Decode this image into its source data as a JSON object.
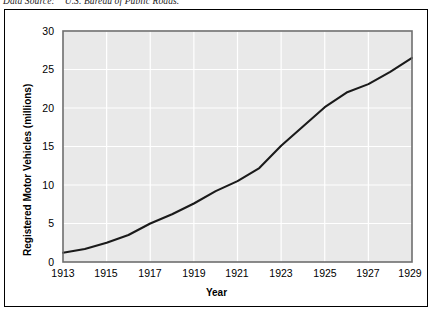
{
  "source_note": "Data Source:    U.S. Bureau of Public Roads.",
  "chart_data": {
    "type": "line",
    "title": "",
    "xlabel": "Year",
    "ylabel": "Registered Motor Vehicles (millions)",
    "xlim": [
      1913,
      1929
    ],
    "ylim": [
      0,
      30
    ],
    "grid": true,
    "legend": "none",
    "line_color": "#1a1a1a",
    "plot_background": "#e9e9e9",
    "gridline_color": "#ffffff",
    "xticks": [
      "1913",
      "1915",
      "1917",
      "1919",
      "1921",
      "1923",
      "1925",
      "1927",
      "1929"
    ],
    "yticks": [
      "0",
      "5",
      "10",
      "15",
      "20",
      "25",
      "30"
    ],
    "x": [
      1913,
      1914,
      1915,
      1916,
      1917,
      1918,
      1919,
      1920,
      1921,
      1922,
      1923,
      1924,
      1925,
      1926,
      1927,
      1928,
      1929
    ],
    "values": [
      1.2,
      1.7,
      2.5,
      3.5,
      5.0,
      6.2,
      7.6,
      9.2,
      10.5,
      12.2,
      15.1,
      17.6,
      20.1,
      22.0,
      23.1,
      24.7,
      26.5
    ],
    "series": [
      {
        "name": "Registered Motor Vehicles",
        "values": [
          1.2,
          1.7,
          2.5,
          3.5,
          5.0,
          6.2,
          7.6,
          9.2,
          10.5,
          12.2,
          15.1,
          17.6,
          20.1,
          22.0,
          23.1,
          24.7,
          26.5
        ]
      }
    ]
  }
}
